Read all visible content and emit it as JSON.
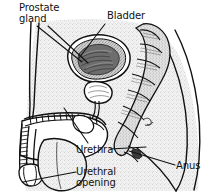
{
  "figure": {
    "background_color": "#ffffff",
    "ink_color": "#111111",
    "tissue_fill": "#efefef"
  },
  "labels": {
    "prostate_gland": "Prostate\ngland",
    "bladder": "Bladder",
    "urethra": "Urethra",
    "urethral_opening": "Urethral\nopening",
    "anus": "Anus"
  },
  "structures": [
    {
      "name": "bladder",
      "label": "Bladder"
    },
    {
      "name": "prostate-gland",
      "label": "Prostate gland"
    },
    {
      "name": "urethra",
      "label": "Urethra"
    },
    {
      "name": "urethral-opening",
      "label": "Urethral opening"
    },
    {
      "name": "anus",
      "label": "Anus"
    },
    {
      "name": "rectum",
      "label": ""
    },
    {
      "name": "penis",
      "label": ""
    },
    {
      "name": "scrotum",
      "label": ""
    },
    {
      "name": "pubic-bone",
      "label": ""
    },
    {
      "name": "buttock-outline",
      "label": ""
    }
  ]
}
